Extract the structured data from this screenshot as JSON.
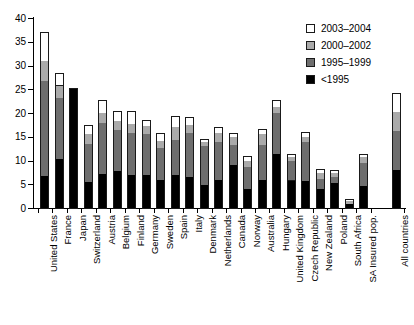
{
  "chart_data": {
    "type": "bar",
    "stacked": true,
    "title": "",
    "xlabel": "",
    "ylabel": "",
    "ylim": [
      0,
      40
    ],
    "yticks": [
      0,
      5,
      10,
      15,
      20,
      25,
      30,
      35,
      40
    ],
    "grid": false,
    "legend_position": "top-right",
    "categories": [
      "United States",
      "France",
      "Japan",
      "Switzerland",
      "Austria",
      "Belgium",
      "Finland",
      "Germany",
      "Sweden",
      "Spain",
      "Italy",
      "Denmark",
      "Netherlands",
      "Canada",
      "Norway",
      "Australia",
      "Hungary",
      "United Kingdom",
      "Czech Republic",
      "New Zealand",
      "Poland",
      "South Africa",
      "SA Insured pop.",
      "All countries"
    ],
    "series": [
      {
        "name": "<1995",
        "color": "#000000",
        "values": [
          7.0,
          10.5,
          25.2,
          5.6,
          7.3,
          8.1,
          7.1,
          7.1,
          6.1,
          7.1,
          6.7,
          5.0,
          6.1,
          9.2,
          4.2,
          6.2,
          11.5,
          6.0,
          5.9,
          4.3,
          5.4,
          1.1,
          4.9,
          8.3
        ]
      },
      {
        "name": "1995-1999",
        "color": "#6e6e6e",
        "values": [
          20.0,
          12.8,
          0.0,
          8.0,
          10.8,
          8.5,
          9.0,
          8.6,
          6.8,
          7.4,
          9.2,
          8.3,
          8.0,
          4.3,
          4.6,
          7.3,
          8.7,
          4.2,
          8.2,
          2.0,
          1.4,
          0.0,
          4.7,
          8.2
        ]
      },
      {
        "name": "2000-2002",
        "color": "#aaaaaa",
        "values": [
          4.1,
          2.7,
          0.0,
          2.1,
          2.1,
          2.0,
          1.9,
          1.7,
          1.5,
          2.8,
          1.7,
          0.9,
          2.0,
          1.6,
          1.3,
          2.2,
          1.3,
          0.8,
          1.0,
          1.2,
          0.8,
          0.6,
          1.3,
          4.0
        ]
      },
      {
        "name": "2003-2004",
        "color": "#ffffff",
        "values": [
          5.9,
          2.4,
          0.0,
          1.8,
          2.5,
          1.9,
          2.5,
          1.2,
          1.3,
          2.1,
          1.6,
          0.4,
          1.0,
          0.6,
          0.9,
          0.9,
          1.2,
          0.4,
          0.9,
          0.7,
          0.4,
          0.3,
          0.4,
          3.8
        ]
      }
    ],
    "totals": [
      37.0,
      28.4,
      25.2,
      17.5,
      22.7,
      20.5,
      20.5,
      18.6,
      15.7,
      19.4,
      19.2,
      14.6,
      17.1,
      15.7,
      11.0,
      16.6,
      22.7,
      11.4,
      16.0,
      8.2,
      8.0,
      2.0,
      11.3,
      24.3
    ]
  },
  "legend": {
    "items": [
      {
        "label": "2003–2004",
        "color": "#ffffff"
      },
      {
        "label": "2000–2002",
        "color": "#aaaaaa"
      },
      {
        "label": "1995–1999",
        "color": "#6e6e6e"
      },
      {
        "label": "<1995",
        "color": "#000000"
      }
    ]
  }
}
